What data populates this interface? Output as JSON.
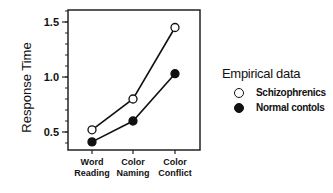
{
  "chart_data": {
    "type": "line",
    "title": "",
    "xlabel": "",
    "ylabel": "Response Time",
    "ylim": [
      0.35,
      1.63
    ],
    "yticks": [
      0.5,
      1.0,
      1.5
    ],
    "ytick_labels": [
      "0.5",
      "1.0",
      "1.5"
    ],
    "minor_tick_step": 0.1,
    "categories": [
      "Word Reading",
      "Color Naming",
      "Color Conflict"
    ],
    "category_lines": [
      [
        "Word",
        "Reading"
      ],
      [
        "Color",
        "Naming"
      ],
      [
        "Color",
        "Conflict"
      ]
    ],
    "series": [
      {
        "name": "Schizophrenics",
        "marker": "open-circle",
        "values": [
          0.52,
          0.8,
          1.45
        ]
      },
      {
        "name": "Normal contols",
        "marker": "filled-circle",
        "values": [
          0.41,
          0.6,
          1.03
        ]
      }
    ],
    "legend": {
      "title": "Empirical data",
      "position": "right"
    },
    "grid": false
  }
}
